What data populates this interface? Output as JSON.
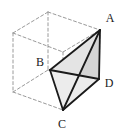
{
  "figure": {
    "type": "geometry-diagram",
    "background_color": "#ffffff",
    "solid_line_color": "#1a1a1a",
    "dashed_line_color": "#9a9a9a",
    "shade_light": "#e8e8e8",
    "shade_mid": "#d2d2d2",
    "labels": [
      {
        "name": "A",
        "text": "A",
        "x": 110,
        "y": 22
      },
      {
        "name": "B",
        "text": "B",
        "x": 40,
        "y": 66
      },
      {
        "name": "C",
        "text": "C",
        "x": 62,
        "y": 128
      },
      {
        "name": "D",
        "text": "D",
        "x": 109,
        "y": 87
      }
    ],
    "vertices": {
      "A": {
        "x": 100,
        "y": 30
      },
      "B": {
        "x": 50,
        "y": 70
      },
      "C": {
        "x": 63,
        "y": 110
      },
      "D": {
        "x": 99,
        "y": 79
      }
    },
    "cube_corners": {
      "front_top_left": {
        "x": 13,
        "y": 33
      },
      "front_top_right": {
        "x": 63,
        "y": 52
      },
      "back_top_left": {
        "x": 48,
        "y": 12
      },
      "back_top_right": {
        "x": 100,
        "y": 30
      },
      "front_bottom_left": {
        "x": 13,
        "y": 92
      },
      "front_bottom_right": {
        "x": 63,
        "y": 110
      },
      "back_bottom_left": {
        "x": 48,
        "y": 70
      },
      "back_bottom_right": {
        "x": 99,
        "y": 79
      }
    }
  }
}
